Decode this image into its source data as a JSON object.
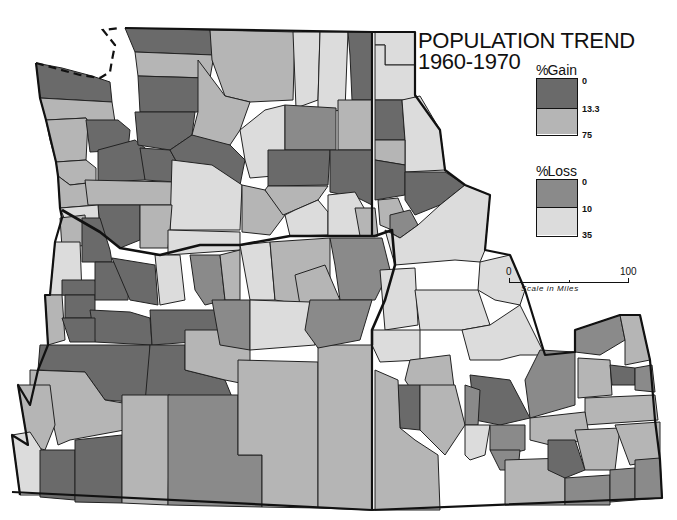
{
  "title": {
    "line1": "POPULATION TREND",
    "line2": "1960-1970"
  },
  "legend": {
    "gain": {
      "heading_symbol": "%",
      "heading": "Gain",
      "ticks": [
        "0",
        "13.3",
        "75"
      ],
      "classes": [
        {
          "range": "0-13.3",
          "color": "#6a6a6a"
        },
        {
          "range": "13.3-75",
          "color": "#b5b5b5"
        }
      ]
    },
    "loss": {
      "heading_symbol": "%",
      "heading": "Loss",
      "ticks": [
        "0",
        "10",
        "35"
      ],
      "classes": [
        {
          "range": "0-10",
          "color": "#8a8a8a"
        },
        {
          "range": "10-35",
          "color": "#dcdcdc"
        }
      ]
    }
  },
  "scale": {
    "start": "0",
    "end": "100",
    "caption": "Scale in Miles"
  },
  "colors": {
    "gain_low": "#6a6a6a",
    "gain_high": "#b5b5b5",
    "loss_low": "#8a8a8a",
    "loss_high": "#dcdcdc",
    "border": "#111111",
    "background": "#ffffff"
  },
  "map": {
    "regions": [
      "Washington",
      "Oregon",
      "Idaho"
    ],
    "classes_legend_order": [
      "gain_low",
      "gain_high",
      "loss_low",
      "loss_high"
    ]
  }
}
